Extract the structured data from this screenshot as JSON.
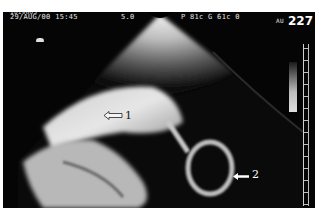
{
  "header": {
    "patient_id": "1019803",
    "datetime": "29/AUG/00 15:45",
    "depth": "5.0",
    "params": "P 81c G 61c 0",
    "mode": "AU",
    "frame_number": "227"
  },
  "annotations": [
    {
      "label": "1",
      "icon": "hollow-arrow-left-icon"
    },
    {
      "label": "2",
      "icon": "arrow-left-icon"
    }
  ],
  "image": {
    "type": "ultrasound-sector-scan",
    "colors": {
      "background": "#050505",
      "tissue": "#d8d8d8",
      "text": "#e8e8e8"
    }
  }
}
